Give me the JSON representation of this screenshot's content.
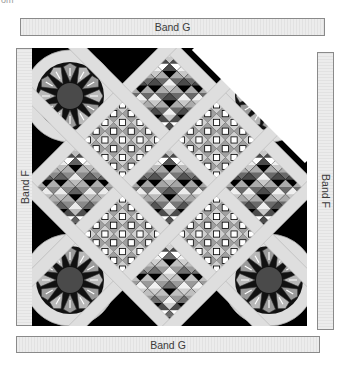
{
  "page": {
    "top_fragment": "om"
  },
  "bands": {
    "top": {
      "label": "Band G",
      "x": 20,
      "y": 18,
      "w": 305,
      "h": 18
    },
    "bottom": {
      "label": "Band G",
      "x": 16,
      "y": 336,
      "w": 304,
      "h": 17
    },
    "left": {
      "label": "Band F",
      "x": 16,
      "y": 48,
      "w": 17,
      "h": 278
    },
    "right": {
      "label": "Band F",
      "x": 317,
      "y": 52,
      "w": 17,
      "h": 278
    }
  },
  "quilt": {
    "width": 275,
    "height": 278,
    "background": "#000000",
    "sashing_color": "#dedede",
    "sashing_edge": "#b5b5b5",
    "clipped_corner": "top-right",
    "blocks": [
      {
        "position": "top",
        "pattern": "nine-patch-star"
      },
      {
        "position": "left",
        "pattern": "checker-star"
      },
      {
        "position": "center",
        "pattern": "flower-star"
      },
      {
        "position": "right",
        "pattern": "nine-patch-star"
      },
      {
        "position": "bottom",
        "pattern": "pinwheel-star"
      },
      {
        "position": "upper-left",
        "pattern": "white-squares"
      },
      {
        "position": "upper-right",
        "pattern": "white-squares"
      },
      {
        "position": "lower-left",
        "pattern": "white-squares"
      },
      {
        "position": "lower-right",
        "pattern": "white-squares"
      }
    ],
    "corner_medallions": [
      {
        "position": "top-left",
        "pattern": "fan-star"
      },
      {
        "position": "top-right",
        "pattern": "fan-star"
      },
      {
        "position": "bottom-left",
        "pattern": "fan-star"
      },
      {
        "position": "bottom-right",
        "pattern": "fan-star"
      }
    ]
  }
}
